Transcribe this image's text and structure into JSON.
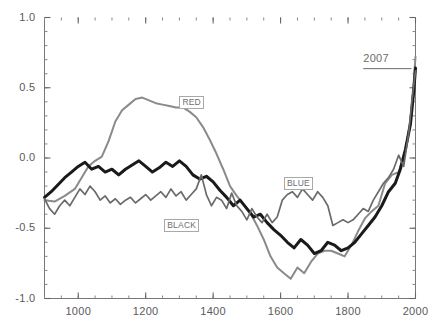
{
  "chart_data": {
    "type": "line",
    "title": "",
    "subtitle": "",
    "xlabel": "",
    "ylabel": "",
    "xlim": [
      900,
      2000
    ],
    "ylim": [
      -1.0,
      1.0
    ],
    "grid": false,
    "legend_position": "inline-labels",
    "x_ticks": [
      1000,
      1200,
      1400,
      1600,
      1800,
      2000
    ],
    "x_tick_labels": [
      "1000",
      "1200",
      "1400",
      "1600",
      "1800",
      "2000"
    ],
    "x_minor_tick_interval": 50,
    "y_ticks": [
      -1.0,
      -0.5,
      0.0,
      0.5,
      1.0
    ],
    "y_tick_labels": [
      "-1.0",
      "-0.5",
      "0.0",
      "0.5",
      "1.0"
    ],
    "y_minor_tick_interval": 0.1,
    "annotations": [
      {
        "name": "year-annotation",
        "text": "2007",
        "x": 1845,
        "y": 0.7,
        "underline": true
      }
    ],
    "series": [
      {
        "name": "RED",
        "label": "RED",
        "color": "#8a8a8a",
        "width": 2.0,
        "label_x": 1300,
        "label_y": 0.4,
        "x": [
          900,
          930,
          960,
          990,
          1010,
          1030,
          1050,
          1070,
          1090,
          1110,
          1130,
          1150,
          1170,
          1190,
          1210,
          1230,
          1250,
          1270,
          1290,
          1310,
          1330,
          1350,
          1370,
          1390,
          1410,
          1430,
          1450,
          1470,
          1490,
          1510,
          1530,
          1550,
          1570,
          1590,
          1610,
          1630,
          1650,
          1670,
          1690,
          1710,
          1730,
          1750,
          1770,
          1790,
          1810,
          1830,
          1850,
          1870,
          1890,
          1910,
          1930,
          1950,
          1970,
          1985,
          1995,
          2000
        ],
        "y": [
          -0.3,
          -0.31,
          -0.27,
          -0.22,
          -0.14,
          -0.06,
          -0.02,
          0.01,
          0.12,
          0.26,
          0.34,
          0.38,
          0.42,
          0.43,
          0.41,
          0.39,
          0.38,
          0.37,
          0.36,
          0.36,
          0.33,
          0.29,
          0.22,
          0.13,
          0.03,
          -0.08,
          -0.2,
          -0.27,
          -0.33,
          -0.39,
          -0.48,
          -0.58,
          -0.7,
          -0.78,
          -0.82,
          -0.86,
          -0.78,
          -0.82,
          -0.74,
          -0.68,
          -0.66,
          -0.66,
          -0.68,
          -0.7,
          -0.62,
          -0.52,
          -0.43,
          -0.38,
          -0.34,
          -0.18,
          -0.12,
          -0.1,
          0.05,
          0.28,
          0.55,
          0.72
        ]
      },
      {
        "name": "BLACK",
        "label": "BLACK",
        "color": "#1a1a1a",
        "width": 3.0,
        "label_x": 1255,
        "label_y": -0.48,
        "x": [
          900,
          920,
          940,
          960,
          980,
          1000,
          1020,
          1040,
          1060,
          1080,
          1100,
          1120,
          1140,
          1160,
          1180,
          1200,
          1220,
          1240,
          1260,
          1280,
          1300,
          1320,
          1340,
          1360,
          1380,
          1400,
          1420,
          1440,
          1460,
          1480,
          1500,
          1520,
          1540,
          1560,
          1580,
          1600,
          1620,
          1640,
          1660,
          1680,
          1700,
          1720,
          1740,
          1760,
          1780,
          1800,
          1820,
          1840,
          1860,
          1880,
          1900,
          1920,
          1940,
          1955,
          1970,
          1985,
          1995,
          2000
        ],
        "y": [
          -0.28,
          -0.24,
          -0.19,
          -0.14,
          -0.1,
          -0.06,
          -0.03,
          -0.08,
          -0.06,
          -0.1,
          -0.08,
          -0.12,
          -0.08,
          -0.05,
          -0.02,
          -0.06,
          -0.1,
          -0.07,
          -0.03,
          -0.06,
          -0.02,
          -0.06,
          -0.12,
          -0.15,
          -0.13,
          -0.17,
          -0.23,
          -0.28,
          -0.34,
          -0.3,
          -0.36,
          -0.42,
          -0.4,
          -0.46,
          -0.51,
          -0.55,
          -0.6,
          -0.64,
          -0.58,
          -0.62,
          -0.68,
          -0.66,
          -0.6,
          -0.62,
          -0.66,
          -0.64,
          -0.6,
          -0.54,
          -0.48,
          -0.42,
          -0.34,
          -0.24,
          -0.18,
          -0.08,
          0.06,
          0.24,
          0.48,
          0.64
        ]
      },
      {
        "name": "BLUE",
        "label": "BLUE",
        "color": "#6a6a6a",
        "width": 1.7,
        "label_x": 1610,
        "label_y": -0.18,
        "x": [
          900,
          915,
          930,
          945,
          960,
          975,
          990,
          1005,
          1020,
          1035,
          1050,
          1065,
          1080,
          1095,
          1110,
          1125,
          1140,
          1155,
          1170,
          1185,
          1200,
          1215,
          1230,
          1245,
          1260,
          1275,
          1290,
          1305,
          1320,
          1335,
          1350,
          1365,
          1380,
          1395,
          1410,
          1425,
          1440,
          1455,
          1470,
          1485,
          1500,
          1515,
          1530,
          1545,
          1560,
          1575,
          1590,
          1605,
          1620,
          1635,
          1650,
          1665,
          1680,
          1695,
          1710,
          1725,
          1740,
          1755,
          1770,
          1785,
          1800,
          1815,
          1830,
          1845,
          1860,
          1875,
          1890,
          1905,
          1920,
          1935,
          1950,
          1965,
          1980,
          1990,
          2000
        ],
        "y": [
          -0.29,
          -0.36,
          -0.4,
          -0.34,
          -0.3,
          -0.34,
          -0.28,
          -0.22,
          -0.26,
          -0.2,
          -0.24,
          -0.3,
          -0.27,
          -0.32,
          -0.29,
          -0.33,
          -0.3,
          -0.28,
          -0.32,
          -0.29,
          -0.26,
          -0.3,
          -0.27,
          -0.24,
          -0.28,
          -0.22,
          -0.27,
          -0.24,
          -0.3,
          -0.26,
          -0.22,
          -0.12,
          -0.26,
          -0.34,
          -0.28,
          -0.3,
          -0.36,
          -0.25,
          -0.34,
          -0.38,
          -0.44,
          -0.36,
          -0.42,
          -0.46,
          -0.4,
          -0.46,
          -0.42,
          -0.3,
          -0.26,
          -0.24,
          -0.28,
          -0.22,
          -0.26,
          -0.3,
          -0.24,
          -0.28,
          -0.34,
          -0.48,
          -0.46,
          -0.44,
          -0.46,
          -0.44,
          -0.4,
          -0.36,
          -0.38,
          -0.3,
          -0.24,
          -0.18,
          -0.14,
          -0.08,
          0.02,
          -0.06,
          0.18,
          0.42,
          0.62
        ]
      }
    ]
  }
}
